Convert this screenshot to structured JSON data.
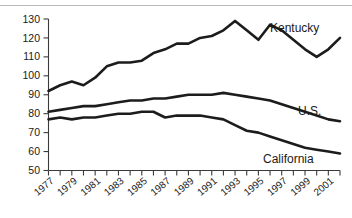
{
  "chart_data": {
    "type": "line",
    "title": "",
    "subtitle": "",
    "xlabel": "",
    "ylabel": "",
    "xlim": [
      1977,
      2002
    ],
    "ylim": [
      50,
      130
    ],
    "yticks": [
      50,
      60,
      70,
      80,
      90,
      100,
      110,
      120,
      130
    ],
    "xticks": [
      1977,
      1978,
      1979,
      1980,
      1981,
      1982,
      1983,
      1984,
      1985,
      1986,
      1987,
      1988,
      1989,
      1990,
      1991,
      1992,
      1993,
      1994,
      1995,
      1996,
      1997,
      1998,
      1999,
      2000,
      2001,
      2002
    ],
    "xtick_labels": [
      "1977",
      "",
      "1979",
      "",
      "1981",
      "",
      "1983",
      "",
      "1985",
      "",
      "1987",
      "",
      "1989",
      "",
      "1991",
      "",
      "1993",
      "",
      "1995",
      "",
      "1997",
      "",
      "1999",
      "",
      "2001",
      ""
    ],
    "grid": false,
    "legend_position": "inline-right",
    "x": [
      1977,
      1978,
      1979,
      1980,
      1981,
      1982,
      1983,
      1984,
      1985,
      1986,
      1987,
      1988,
      1989,
      1990,
      1991,
      1992,
      1993,
      1994,
      1995,
      1996,
      1997,
      1998,
      1999,
      2000,
      2001,
      2002
    ],
    "series": [
      {
        "name": "Kentucky",
        "label": "Kentucky",
        "color": "#1c1c1c",
        "values": [
          92,
          95,
          97,
          95,
          99,
          105,
          107,
          107,
          108,
          112,
          114,
          117,
          117,
          120,
          121,
          124,
          129,
          124,
          119,
          127,
          124,
          119,
          114,
          110,
          114,
          120
        ]
      },
      {
        "name": "U.S.",
        "label": "U.S.",
        "color": "#1c1c1c",
        "values": [
          81,
          82,
          83,
          84,
          84,
          85,
          86,
          87,
          87,
          88,
          88,
          89,
          90,
          90,
          90,
          91,
          90,
          89,
          88,
          87,
          85,
          83,
          81,
          79,
          77,
          76
        ]
      },
      {
        "name": "California",
        "label": "California",
        "color": "#1c1c1c",
        "values": [
          77,
          78,
          77,
          78,
          78,
          79,
          80,
          80,
          81,
          81,
          78,
          79,
          79,
          79,
          78,
          77,
          74,
          71,
          70,
          68,
          66,
          64,
          62,
          61,
          60,
          59
        ]
      }
    ]
  },
  "axis": {
    "y_tick_labels": [
      "130",
      "120",
      "110",
      "100",
      "90",
      "80",
      "70",
      "60",
      "50"
    ],
    "x_tick_labels": [
      "1977",
      "1979",
      "1981",
      "1983",
      "1985",
      "1987",
      "1989",
      "1991",
      "1993",
      "1995",
      "1997",
      "1999",
      "2001"
    ]
  },
  "series_labels": {
    "kentucky": "Kentucky",
    "us": "U.S.",
    "california": "California"
  }
}
